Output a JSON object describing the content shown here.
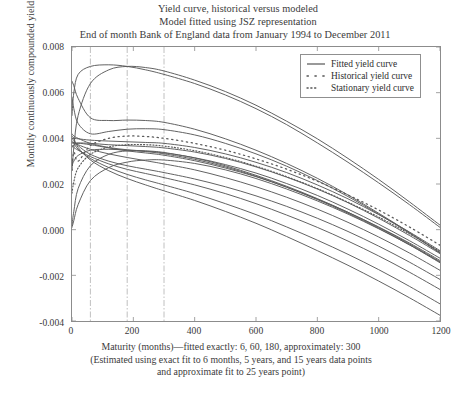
{
  "figure": {
    "title_lines": [
      "Yield curve, historical versus modeled",
      "Model fitted using JSZ representation",
      "End of month Bank of England data from January 1994 to December 2011"
    ],
    "caption_lines": [
      "Maturity (months)—fitted exactly: 6, 60, 180, approximately: 300",
      "(Estimated using exact fit to 6 months, 5 years, and 15 years data points",
      "and approximate fit to 25 years point)"
    ]
  },
  "chart_data": {
    "type": "line",
    "title": "Yield curve, historical versus modeled",
    "subtitle": "Model fitted using JSZ representation",
    "subtitle2": "End of month Bank of England data from January 1994 to December 2011",
    "xlabel": "Maturity (months)—fitted exactly: 6, 60, 180, approximately: 300",
    "ylabel": "Monthly continuously compounded yield",
    "xlim": [
      0,
      1200
    ],
    "ylim": [
      -0.004,
      0.008
    ],
    "xticks": [
      0,
      200,
      400,
      600,
      800,
      1000,
      1200
    ],
    "xtick_labels": [
      "0",
      "200",
      "400",
      "600",
      "800",
      "1000",
      "1200"
    ],
    "yticks": [
      -0.004,
      -0.002,
      0.0,
      0.002,
      0.004,
      0.006,
      0.008
    ],
    "ytick_labels": [
      "-0.004",
      "-0.002",
      "0.000",
      "0.002",
      "0.004",
      "0.006",
      "0.008"
    ],
    "grid": false,
    "vertical_reference_lines": [
      60,
      180,
      300
    ],
    "vertical_reference_line_style": "dash-dot thin grey",
    "legend_position": "upper right",
    "legend": [
      {
        "label": "Fitted yield curve",
        "style": "solid"
      },
      {
        "label": "Historical yield curve",
        "style": "dotted-wide"
      },
      {
        "label": "Stationary yield curve",
        "style": "dotted-tight"
      }
    ],
    "x_samples": [
      0,
      6,
      20,
      60,
      120,
      180,
      240,
      300,
      400,
      500,
      600,
      700,
      800,
      900,
      1000,
      1100,
      1200
    ],
    "series": [
      {
        "name": "fitted-1",
        "style": "solid",
        "values": [
          0.005,
          0.006,
          0.0068,
          0.00715,
          0.00722,
          0.00715,
          0.007,
          0.0068,
          0.0064,
          0.0059,
          0.0053,
          0.0046,
          0.0038,
          0.00295,
          0.00205,
          0.0011,
          0.0001
        ]
      },
      {
        "name": "fitted-2",
        "style": "solid",
        "values": [
          0.0026,
          0.0036,
          0.005,
          0.0064,
          0.007,
          0.00715,
          0.0071,
          0.00695,
          0.00655,
          0.00605,
          0.00545,
          0.00475,
          0.00398,
          0.00312,
          0.0022,
          0.00122,
          0.0002
        ]
      },
      {
        "name": "fitted-3",
        "style": "solid",
        "values": [
          0.0065,
          0.0063,
          0.00575,
          0.0049,
          0.00478,
          0.0048,
          0.00478,
          0.0047,
          0.0044,
          0.00398,
          0.00348,
          0.0029,
          0.00225,
          0.00152,
          0.00072,
          -0.00012,
          -0.001
        ]
      },
      {
        "name": "fitted-4",
        "style": "solid",
        "values": [
          0.0058,
          0.0053,
          0.00465,
          0.0042,
          0.0043,
          0.0044,
          0.00442,
          0.00438,
          0.00415,
          0.00378,
          0.00332,
          0.00278,
          0.00215,
          0.00145,
          0.00068,
          -0.00015,
          -0.00102
        ]
      },
      {
        "name": "fitted-5",
        "style": "solid",
        "values": [
          0.004,
          0.004,
          0.00398,
          0.00392,
          0.00388,
          0.00385,
          0.00382,
          0.00378,
          0.0036,
          0.00332,
          0.00295,
          0.0025,
          0.00196,
          0.00135,
          0.00066,
          -0.0001,
          -0.00092
        ]
      },
      {
        "name": "fitted-6",
        "style": "solid",
        "values": [
          0.0038,
          0.0038,
          0.0038,
          0.00378,
          0.00372,
          0.00368,
          0.00364,
          0.00358,
          0.0034,
          0.00312,
          0.00275,
          0.0023,
          0.00178,
          0.00118,
          0.0005,
          -0.00025,
          -0.00105
        ]
      },
      {
        "name": "fitted-7",
        "style": "solid",
        "values": [
          0.0042,
          0.0041,
          0.004,
          0.00378,
          0.0036,
          0.0035,
          0.00344,
          0.00336,
          0.00315,
          0.00285,
          0.00248,
          0.00202,
          0.0015,
          0.0009,
          0.00024,
          -0.00048,
          -0.00125
        ]
      },
      {
        "name": "fitted-8",
        "style": "solid",
        "values": [
          0.0036,
          0.0037,
          0.00378,
          0.00372,
          0.00358,
          0.00345,
          0.00336,
          0.00326,
          0.00302,
          0.0027,
          0.00232,
          0.00186,
          0.00134,
          0.00076,
          0.00012,
          -0.00058,
          -0.00135
        ]
      },
      {
        "name": "fitted-9",
        "style": "solid",
        "values": [
          0.0028,
          0.003,
          0.00325,
          0.00348,
          0.00352,
          0.00348,
          0.00342,
          0.00332,
          0.00308,
          0.00275,
          0.00234,
          0.00186,
          0.00132,
          0.00072,
          6e-05,
          -0.00066,
          -0.00145
        ]
      },
      {
        "name": "fitted-10",
        "style": "solid",
        "values": [
          0.0002,
          0.0008,
          0.0018,
          0.0028,
          0.0033,
          0.00345,
          0.00345,
          0.00338,
          0.00314,
          0.0028,
          0.00238,
          0.0019,
          0.00136,
          0.00076,
          0.0001,
          -0.00062,
          -0.0014
        ]
      },
      {
        "name": "fitted-11",
        "style": "solid",
        "values": [
          0.0001,
          0.0004,
          0.0011,
          0.00215,
          0.00272,
          0.00296,
          0.00305,
          0.00305,
          0.0029,
          0.00262,
          0.00224,
          0.00178,
          0.00126,
          0.00068,
          4e-05,
          -0.00066,
          -0.00142
        ]
      },
      {
        "name": "fitted-12",
        "style": "solid",
        "values": [
          0.0038,
          0.0038,
          0.00372,
          0.00352,
          0.00332,
          0.00316,
          0.00302,
          0.00288,
          0.00262,
          0.00228,
          0.00188,
          0.00142,
          0.0009,
          0.00032,
          -0.00032,
          -0.00102,
          -0.00178
        ]
      },
      {
        "name": "fitted-13",
        "style": "solid",
        "values": [
          0.004,
          0.0039,
          0.00368,
          0.0033,
          0.003,
          0.0028,
          0.00265,
          0.0025,
          0.00222,
          0.00188,
          0.00148,
          0.00102,
          0.0005,
          -8e-05,
          -0.00072,
          -0.00142,
          -0.00218
        ]
      },
      {
        "name": "fitted-14",
        "style": "solid",
        "values": [
          0.0037,
          0.0036,
          0.00348,
          0.0032,
          0.00288,
          0.00264,
          0.00246,
          0.00228,
          0.00196,
          0.00158,
          0.00114,
          0.00064,
          0.0001,
          -0.0005,
          -0.00115,
          -0.00186,
          -0.00262
        ]
      },
      {
        "name": "fitted-15",
        "style": "solid",
        "values": [
          0.0039,
          0.0038,
          0.00352,
          0.00312,
          0.00272,
          0.00242,
          0.00218,
          0.00196,
          0.00158,
          0.00114,
          0.00066,
          0.00012,
          -0.00046,
          -0.00108,
          -0.00175,
          -0.00248,
          -0.00325
        ]
      },
      {
        "name": "fitted-16",
        "style": "solid",
        "values": [
          0.0041,
          0.004,
          0.0036,
          0.00305,
          0.00258,
          0.00224,
          0.00196,
          0.0017,
          0.00128,
          0.0008,
          0.00028,
          -0.0003,
          -0.00092,
          -0.00156,
          -0.00225,
          -0.00298,
          -0.00375
        ]
      },
      {
        "name": "historical",
        "style": "dotted-wide",
        "values": [
          0.0026,
          0.0034,
          0.003,
          0.00368,
          0.004,
          0.0041,
          0.00408,
          0.004,
          0.00378,
          0.00348,
          0.0031,
          0.00265,
          0.00212,
          0.00152,
          0.00086,
          0.00012,
          -0.00068
        ]
      },
      {
        "name": "stationary",
        "style": "dotted-tight",
        "values": [
          0.0016,
          0.0021,
          0.0027,
          0.0033,
          0.00362,
          0.00372,
          0.00372,
          0.00366,
          0.00346,
          0.00316,
          0.00278,
          0.00232,
          0.0018,
          0.0012,
          0.00055,
          -0.00018,
          -0.00096
        ]
      }
    ]
  },
  "axis": {
    "ylabel": "Monthly continuously compounded yield",
    "y_labels": [
      "0.008",
      "0.006",
      "0.004",
      "0.002",
      "0.000",
      "-0.002",
      "-0.004"
    ],
    "x_labels": [
      "0",
      "200",
      "400",
      "600",
      "800",
      "1000",
      "1200"
    ]
  },
  "legend": {
    "items": [
      {
        "label": "Fitted yield curve"
      },
      {
        "label": "Historical yield curve"
      },
      {
        "label": "Stationary yield curve"
      }
    ]
  },
  "colors": {
    "axis": "#8c8c8c",
    "curve": "#5a5a5a",
    "refline": "#b0b0b0",
    "text": "#3a3a3a",
    "background": "#ffffff"
  }
}
